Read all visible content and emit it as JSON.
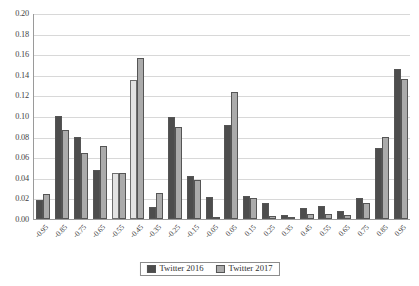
{
  "chart_data": {
    "type": "bar",
    "title": "",
    "xlabel": "",
    "ylabel": "",
    "ylim": [
      0.0,
      0.2
    ],
    "ytick_step": 0.02,
    "grid": true,
    "legend_position": "bottom-center",
    "categories": [
      "-0.95",
      "-0.85",
      "-0.75",
      "-0.65",
      "-0.55",
      "-0.45",
      "-0.35",
      "-0.25",
      "-0.15",
      "-0.05",
      "0.05",
      "0.15",
      "0.25",
      "0.35",
      "0.45",
      "0.55",
      "0.65",
      "0.75",
      "0.85",
      "0.95"
    ],
    "ytick_labels": [
      "0.20",
      "0.18",
      "0.16",
      "0.14",
      "0.12",
      "0.10",
      "0.08",
      "0.06",
      "0.04",
      "0.02",
      "0.00"
    ],
    "ytick_values": [
      0.2,
      0.18,
      0.16,
      0.14,
      0.12,
      0.1,
      0.08,
      0.06,
      0.04,
      0.02,
      0.0
    ],
    "series": [
      {
        "name": "Twitter 2016",
        "color": "#4d4d4d",
        "values": [
          0.018,
          0.1,
          0.08,
          0.048,
          0.045,
          0.135,
          0.012,
          0.099,
          0.042,
          0.021,
          0.091,
          0.022,
          0.016,
          0.004,
          0.011,
          0.013,
          0.008,
          0.02,
          0.069,
          0.146
        ]
      },
      {
        "name": "Twitter 2017",
        "color": "#ababab",
        "values": [
          0.024,
          0.086,
          0.064,
          0.071,
          0.045,
          0.156,
          0.025,
          0.089,
          0.038,
          0.002,
          0.123,
          0.02,
          0.003,
          0.001,
          0.005,
          0.005,
          0.004,
          0.016,
          0.08,
          0.136
        ]
      }
    ]
  },
  "legend": {
    "entries": [
      {
        "label": "Twitter 2016"
      },
      {
        "label": "Twitter 2017"
      }
    ]
  }
}
